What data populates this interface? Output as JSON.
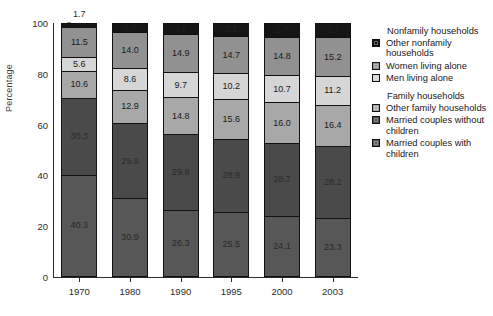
{
  "chart_data": {
    "type": "bar",
    "stacked": true,
    "title": "",
    "xlabel": "",
    "ylabel": "Percentage",
    "ylim": [
      0,
      100
    ],
    "yticks": [
      0,
      20,
      40,
      60,
      80,
      100
    ],
    "grid": false,
    "legend_position": "right",
    "categories": [
      "1970",
      "1980",
      "1990",
      "1995",
      "2000",
      "2003"
    ],
    "series": [
      {
        "name": "Married couples with children",
        "group": "Family households",
        "color": "#575757",
        "values": [
          40.3,
          30.9,
          26.3,
          25.5,
          24.1,
          23.3
        ]
      },
      {
        "name": "Married couples without children",
        "group": "Family households",
        "color": "#4a4a4a",
        "values": [
          30.3,
          29.9,
          29.8,
          28.9,
          28.7,
          28.2
        ]
      },
      {
        "name": "Other family households",
        "group": "Family households",
        "color": "#a8a8a8",
        "values": [
          10.6,
          12.9,
          14.8,
          15.6,
          16.0,
          16.4
        ]
      },
      {
        "name": "Men living alone",
        "group": "Nonfamily households",
        "color": "#d6d6d6",
        "values": [
          5.6,
          8.6,
          9.7,
          10.2,
          10.7,
          11.2
        ]
      },
      {
        "name": "Women living alone",
        "group": "Nonfamily households",
        "color": "#919191",
        "values": [
          11.5,
          14.0,
          14.9,
          14.7,
          14.8,
          15.2
        ]
      },
      {
        "name": "Other nonfamily households",
        "group": "Nonfamily households",
        "color": "#151515",
        "values": [
          1.7,
          3.7,
          4.5,
          5.1,
          5.7,
          5.7
        ]
      }
    ],
    "labels": {
      "1970": [
        "40.3",
        "30.3",
        "10.6",
        "5.6",
        "11.5",
        "1.7"
      ],
      "1980": [
        "30.9",
        "29.9",
        "12.9",
        "8.6",
        "14.0",
        "3.7"
      ],
      "1990": [
        "26.3",
        "29.8",
        "14.8",
        "9.7",
        "14.9",
        "4.5"
      ],
      "1995": [
        "25.5",
        "28.9",
        "15.6",
        "10.2",
        "14.7",
        "5.1"
      ],
      "2000": [
        "24.1",
        "28.7",
        "16.0",
        "10.7",
        "14.8",
        "5.7"
      ],
      "2003": [
        "23.3",
        "28.2",
        "16.4",
        "11.2",
        "15.2",
        "5.7"
      ]
    },
    "outside_label": {
      "category": "1970",
      "text": "1.7"
    }
  },
  "legend": {
    "groups": [
      {
        "title": "Nonfamily households",
        "items": [
          {
            "label": "Other nonfamily households",
            "color": "#151515"
          },
          {
            "label": "Women living alone",
            "color": "#919191"
          },
          {
            "label": "Men living alone",
            "color": "#d6d6d6"
          }
        ]
      },
      {
        "title": "Family households",
        "items": [
          {
            "label": "Other family households",
            "color": "#a8a8a8"
          },
          {
            "label": "Married couples without children",
            "color": "#4a4a4a"
          },
          {
            "label": "Married couples with children",
            "color": "#575757"
          }
        ]
      }
    ]
  },
  "axis": {
    "y_title": "Percentage",
    "y_ticks": [
      "100",
      "80",
      "60",
      "40",
      "20",
      "0"
    ],
    "x_ticks": [
      "1970",
      "1980",
      "1990",
      "1995",
      "2000",
      "2003"
    ]
  }
}
